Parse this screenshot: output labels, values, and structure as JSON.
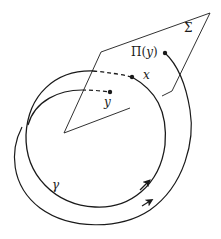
{
  "diagram": {
    "colors": {
      "stroke": "#1a1a1a",
      "background": "#ffffff"
    },
    "labels": {
      "section": "Σ",
      "return_map": "Π(y)",
      "return_map_fn": "Π(",
      "return_map_arg": "y",
      "return_map_close": ")",
      "point_x": "x",
      "point_y": "y",
      "orbit": "γ"
    },
    "elements": [
      {
        "id": "section-plane",
        "kind": "parallelogram",
        "label": "Σ"
      },
      {
        "id": "periodic-orbit",
        "kind": "closed-curve",
        "label": "γ",
        "passes_through": "x"
      },
      {
        "id": "trajectory-from-y",
        "kind": "curve",
        "from": "y",
        "to": "Π(y)"
      },
      {
        "id": "point-x",
        "kind": "point",
        "label": "x"
      },
      {
        "id": "point-y",
        "kind": "point",
        "label": "y"
      },
      {
        "id": "point-pi-y",
        "kind": "point",
        "label": "Π(y)"
      }
    ]
  }
}
